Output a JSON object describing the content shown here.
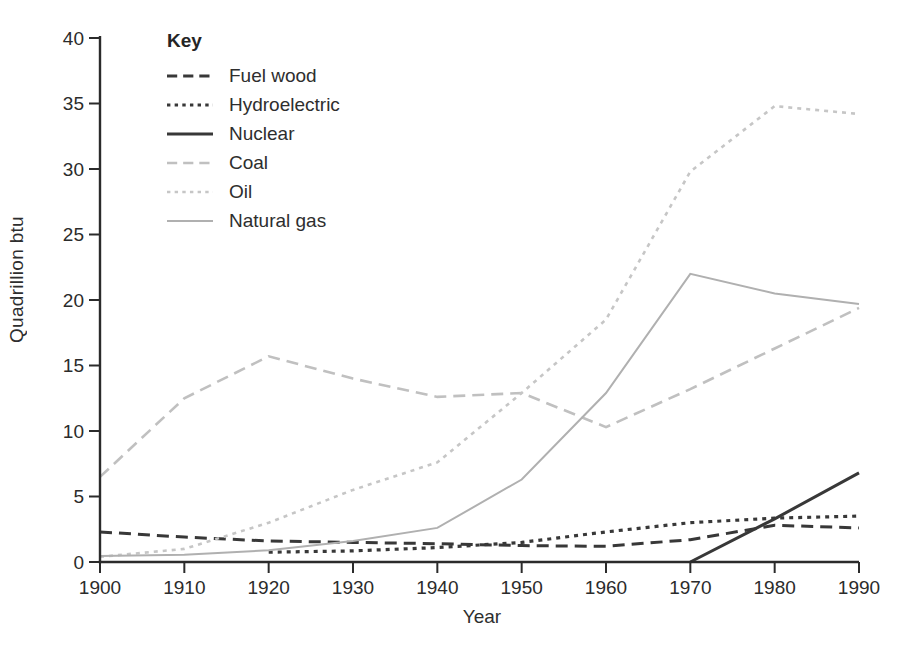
{
  "figure": {
    "background": "#ffffff",
    "axis_color": "#2b2b2b",
    "text_color": "#2e2e2e"
  },
  "chart_data": {
    "type": "line",
    "title": "",
    "xlabel": "Year",
    "ylabel": "Quadrillion btu",
    "legend_title": "Key",
    "legend_position": "top-left-inside",
    "grid": false,
    "x": [
      1900,
      1910,
      1920,
      1930,
      1940,
      1950,
      1960,
      1970,
      1980,
      1990
    ],
    "xticks": [
      "1900",
      "1910",
      "1920",
      "1930",
      "1940",
      "1950",
      "1960",
      "1970",
      "1980",
      "1990"
    ],
    "yticks": [
      "0",
      "5",
      "10",
      "15",
      "20",
      "25",
      "30",
      "35",
      "40"
    ],
    "xlim": [
      1900,
      1990
    ],
    "ylim": [
      0,
      40
    ],
    "series": [
      {
        "name": "Fuel wood",
        "style": "dashed",
        "color": "#383838",
        "width": 3,
        "values": [
          2.3,
          1.9,
          1.6,
          1.5,
          1.4,
          1.25,
          1.2,
          1.7,
          2.8,
          2.6
        ]
      },
      {
        "name": "Hydroelectric",
        "style": "dotted",
        "color": "#383838",
        "width": 3.2,
        "values": [
          null,
          null,
          0.75,
          0.85,
          1.1,
          1.5,
          2.3,
          3.0,
          3.35,
          3.5
        ]
      },
      {
        "name": "Nuclear",
        "style": "solid",
        "color": "#383838",
        "width": 3,
        "values": [
          null,
          null,
          null,
          null,
          null,
          null,
          null,
          0,
          3.3,
          6.8
        ]
      },
      {
        "name": "Coal",
        "style": "dashed",
        "color": "#c0c0c0",
        "width": 2.6,
        "values": [
          6.5,
          12.5,
          15.7,
          14.0,
          12.6,
          12.9,
          10.3,
          13.2,
          16.3,
          19.4
        ]
      },
      {
        "name": "Oil",
        "style": "dotted",
        "color": "#c6c6c6",
        "width": 2.6,
        "values": [
          0.4,
          1.0,
          3.0,
          5.5,
          7.6,
          12.9,
          18.5,
          29.8,
          34.8,
          34.2
        ]
      },
      {
        "name": "Natural gas",
        "style": "solid",
        "color": "#b0b0b0",
        "width": 2,
        "values": [
          0.45,
          0.55,
          0.9,
          1.6,
          2.6,
          6.3,
          12.9,
          22.0,
          20.5,
          19.7
        ]
      }
    ]
  }
}
